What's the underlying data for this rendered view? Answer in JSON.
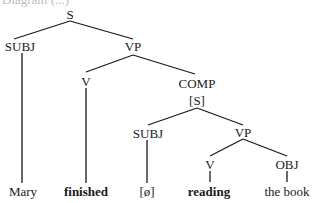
{
  "caption_partial": "Diagram (...)",
  "nodes": {
    "s_root": "S",
    "subj_1": "SUBJ",
    "vp_1": "VP",
    "v_1": "V",
    "comp": "COMP",
    "comp_s": "[S]",
    "subj_2": "SUBJ",
    "vp_2": "VP",
    "v_2": "V",
    "obj": "OBJ"
  },
  "leaves": {
    "mary": "Mary",
    "finished": "finished",
    "null_subj": "[ø]",
    "reading": "reading",
    "the_book": "the book"
  },
  "colors": {
    "ink": "#1a1a1a",
    "background": "#ffffff"
  }
}
